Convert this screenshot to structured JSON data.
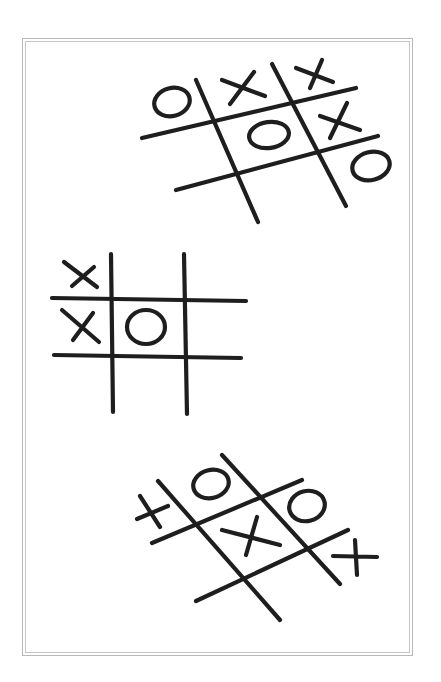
{
  "illustration": {
    "subject": "Hand-drawn tic-tac-toe games",
    "frame": {
      "style": "double-line border",
      "color": "#c0c0c0"
    },
    "ink_color": "#1e1e1e",
    "boards": [
      {
        "name": "board-top",
        "orientation": "tilted",
        "marks": [
          {
            "cell": "top-left",
            "symbol": "O"
          },
          {
            "cell": "top-middle",
            "symbol": "X"
          },
          {
            "cell": "top-right",
            "symbol": "X"
          },
          {
            "cell": "middle-middle",
            "symbol": "O"
          },
          {
            "cell": "middle-right",
            "symbol": "X"
          },
          {
            "cell": "bottom-right-outside",
            "symbol": "O"
          }
        ]
      },
      {
        "name": "board-middle",
        "orientation": "upright",
        "marks": [
          {
            "cell": "top-left",
            "symbol": "X"
          },
          {
            "cell": "middle-left",
            "symbol": "X"
          },
          {
            "cell": "middle-middle",
            "symbol": "O"
          }
        ]
      },
      {
        "name": "board-bottom",
        "orientation": "tilted",
        "marks": [
          {
            "cell": "left-outside",
            "symbol": "X"
          },
          {
            "cell": "top-middle",
            "symbol": "O"
          },
          {
            "cell": "top-right",
            "symbol": "O"
          },
          {
            "cell": "middle-middle",
            "symbol": "X"
          },
          {
            "cell": "right-outside",
            "symbol": "X"
          }
        ]
      }
    ]
  }
}
